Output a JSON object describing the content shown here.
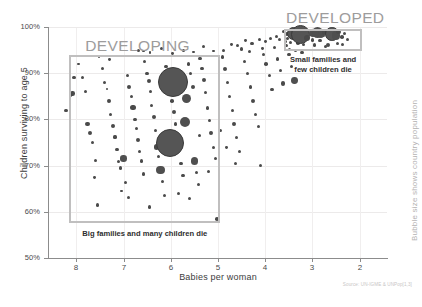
{
  "chart_data": {
    "type": "scatter",
    "title": "",
    "xlabel": "Babies per woman",
    "ylabel": "Children surviving to age 5",
    "xlim": [
      8.6,
      1.4
    ],
    "ylim": [
      50,
      100
    ],
    "x_ticks": [
      "8",
      "7",
      "6",
      "5",
      "4",
      "3",
      "2"
    ],
    "x_tick_values": [
      8,
      7,
      6,
      5,
      4,
      3,
      2
    ],
    "y_ticks": [
      "100%",
      "90%",
      "80%",
      "70%",
      "60%",
      "50%"
    ],
    "y_tick_values": [
      100,
      90,
      80,
      70,
      60,
      50
    ],
    "grid": true,
    "legend": "none",
    "size_note": "Bubble size shows country population",
    "source": "Source: UN-IGME & UNPop[1,3]",
    "annotations": [
      {
        "name": "developing",
        "label": "DEVELOPING",
        "caption": "Big families and many children die",
        "x_range": [
          8.15,
          4.95
        ],
        "y_range": [
          57.5,
          94.0
        ]
      },
      {
        "name": "developed",
        "label": "DEVELOPED",
        "caption_line1": "Small families and",
        "caption_line2": "few children die",
        "x_range": [
          3.6,
          1.95
        ],
        "y_range": [
          94.9,
          99.6
        ]
      }
    ],
    "points": [
      {
        "x": 8.05,
        "y": 89.0,
        "r": 1.6
      },
      {
        "x": 8.08,
        "y": 85.6,
        "r": 2.2
      },
      {
        "x": 8.12,
        "y": 85.3,
        "r": 1.8
      },
      {
        "x": 8.22,
        "y": 82.0,
        "r": 1.6
      },
      {
        "x": 7.86,
        "y": 89.0,
        "r": 1.5
      },
      {
        "x": 7.8,
        "y": 86.0,
        "r": 1.6
      },
      {
        "x": 7.76,
        "y": 79.0,
        "r": 2.4
      },
      {
        "x": 7.72,
        "y": 77.0,
        "r": 2.0
      },
      {
        "x": 7.66,
        "y": 75.0,
        "r": 1.8
      },
      {
        "x": 7.6,
        "y": 71.2,
        "r": 1.5
      },
      {
        "x": 7.62,
        "y": 67.5,
        "r": 1.4
      },
      {
        "x": 7.55,
        "y": 61.5,
        "r": 1.7
      },
      {
        "x": 7.95,
        "y": 92.0,
        "r": 1.3
      },
      {
        "x": 7.45,
        "y": 91.0,
        "r": 1.6
      },
      {
        "x": 7.4,
        "y": 88.0,
        "r": 1.8
      },
      {
        "x": 7.35,
        "y": 86.6,
        "r": 1.4
      },
      {
        "x": 7.3,
        "y": 84.0,
        "r": 1.9
      },
      {
        "x": 7.28,
        "y": 81.0,
        "r": 1.5
      },
      {
        "x": 7.22,
        "y": 78.5,
        "r": 2.0
      },
      {
        "x": 7.18,
        "y": 76.2,
        "r": 1.6
      },
      {
        "x": 7.14,
        "y": 73.5,
        "r": 1.9
      },
      {
        "x": 7.1,
        "y": 70.8,
        "r": 1.5
      },
      {
        "x": 7.06,
        "y": 69.5,
        "r": 1.7
      },
      {
        "x": 7.3,
        "y": 93.0,
        "r": 1.4
      },
      {
        "x": 7.0,
        "y": 71.5,
        "r": 3.2
      },
      {
        "x": 6.96,
        "y": 66.3,
        "r": 1.5
      },
      {
        "x": 6.92,
        "y": 89.5,
        "r": 1.8
      },
      {
        "x": 6.88,
        "y": 87.0,
        "r": 2.2
      },
      {
        "x": 6.84,
        "y": 85.0,
        "r": 1.6
      },
      {
        "x": 6.8,
        "y": 82.5,
        "r": 2.6
      },
      {
        "x": 6.76,
        "y": 80.0,
        "r": 1.9
      },
      {
        "x": 6.72,
        "y": 78.0,
        "r": 1.6
      },
      {
        "x": 6.7,
        "y": 75.5,
        "r": 2.1
      },
      {
        "x": 6.66,
        "y": 73.0,
        "r": 1.5
      },
      {
        "x": 6.62,
        "y": 71.0,
        "r": 1.8
      },
      {
        "x": 6.58,
        "y": 68.2,
        "r": 1.6
      },
      {
        "x": 6.55,
        "y": 92.5,
        "r": 1.5
      },
      {
        "x": 6.5,
        "y": 90.0,
        "r": 1.7
      },
      {
        "x": 6.46,
        "y": 88.4,
        "r": 2.0
      },
      {
        "x": 6.42,
        "y": 86.0,
        "r": 1.5
      },
      {
        "x": 6.4,
        "y": 83.0,
        "r": 1.6
      },
      {
        "x": 6.36,
        "y": 80.5,
        "r": 2.2
      },
      {
        "x": 6.32,
        "y": 77.5,
        "r": 1.5
      },
      {
        "x": 6.3,
        "y": 74.0,
        "r": 2.8
      },
      {
        "x": 6.26,
        "y": 72.0,
        "r": 1.6
      },
      {
        "x": 6.22,
        "y": 69.0,
        "r": 4.2
      },
      {
        "x": 6.18,
        "y": 66.5,
        "r": 1.7
      },
      {
        "x": 6.14,
        "y": 63.5,
        "r": 1.5
      },
      {
        "x": 6.1,
        "y": 91.5,
        "r": 1.6
      },
      {
        "x": 6.06,
        "y": 89.0,
        "r": 2.4
      },
      {
        "x": 6.02,
        "y": 86.5,
        "r": 1.5
      },
      {
        "x": 5.98,
        "y": 84.0,
        "r": 1.8
      },
      {
        "x": 5.94,
        "y": 81.5,
        "r": 2.0
      },
      {
        "x": 5.9,
        "y": 79.0,
        "r": 1.6
      },
      {
        "x": 5.86,
        "y": 76.0,
        "r": 1.9
      },
      {
        "x": 5.82,
        "y": 73.5,
        "r": 1.5
      },
      {
        "x": 5.78,
        "y": 70.5,
        "r": 1.7
      },
      {
        "x": 5.74,
        "y": 67.8,
        "r": 1.6
      },
      {
        "x": 5.95,
        "y": 88.2,
        "r": 15.0
      },
      {
        "x": 6.02,
        "y": 75.0,
        "r": 14.0
      },
      {
        "x": 5.66,
        "y": 84.5,
        "r": 4.5
      },
      {
        "x": 5.7,
        "y": 79.5,
        "r": 5.0
      },
      {
        "x": 5.62,
        "y": 92.0,
        "r": 1.7
      },
      {
        "x": 5.58,
        "y": 90.0,
        "r": 1.5
      },
      {
        "x": 5.54,
        "y": 87.0,
        "r": 2.0
      },
      {
        "x": 5.5,
        "y": 71.0,
        "r": 3.6
      },
      {
        "x": 5.46,
        "y": 68.5,
        "r": 1.6
      },
      {
        "x": 5.42,
        "y": 66.0,
        "r": 1.5
      },
      {
        "x": 5.38,
        "y": 93.2,
        "r": 1.8
      },
      {
        "x": 5.34,
        "y": 91.0,
        "r": 1.6
      },
      {
        "x": 5.3,
        "y": 88.5,
        "r": 2.2
      },
      {
        "x": 5.26,
        "y": 85.8,
        "r": 1.5
      },
      {
        "x": 5.22,
        "y": 82.5,
        "r": 1.7
      },
      {
        "x": 5.18,
        "y": 79.8,
        "r": 1.6
      },
      {
        "x": 5.14,
        "y": 77.0,
        "r": 1.9
      },
      {
        "x": 5.1,
        "y": 74.0,
        "r": 1.5
      },
      {
        "x": 5.06,
        "y": 71.5,
        "r": 1.6
      },
      {
        "x": 5.02,
        "y": 58.5,
        "r": 1.8
      },
      {
        "x": 4.9,
        "y": 93.5,
        "r": 1.6
      },
      {
        "x": 4.86,
        "y": 91.0,
        "r": 2.0
      },
      {
        "x": 4.8,
        "y": 88.0,
        "r": 1.5
      },
      {
        "x": 4.76,
        "y": 85.0,
        "r": 1.7
      },
      {
        "x": 4.7,
        "y": 82.0,
        "r": 1.6
      },
      {
        "x": 4.66,
        "y": 79.0,
        "r": 1.9
      },
      {
        "x": 4.6,
        "y": 76.0,
        "r": 1.5
      },
      {
        "x": 4.55,
        "y": 73.0,
        "r": 1.6
      },
      {
        "x": 4.5,
        "y": 95.2,
        "r": 1.8
      },
      {
        "x": 4.44,
        "y": 92.5,
        "r": 1.5
      },
      {
        "x": 4.38,
        "y": 90.0,
        "r": 1.7
      },
      {
        "x": 4.32,
        "y": 87.0,
        "r": 1.6
      },
      {
        "x": 4.26,
        "y": 84.0,
        "r": 2.1
      },
      {
        "x": 4.2,
        "y": 81.0,
        "r": 1.5
      },
      {
        "x": 4.14,
        "y": 78.5,
        "r": 1.6
      },
      {
        "x": 4.1,
        "y": 70.0,
        "r": 1.7
      },
      {
        "x": 4.04,
        "y": 94.0,
        "r": 1.6
      },
      {
        "x": 3.98,
        "y": 92.0,
        "r": 1.8
      },
      {
        "x": 3.92,
        "y": 89.5,
        "r": 1.5
      },
      {
        "x": 3.86,
        "y": 86.5,
        "r": 1.7
      },
      {
        "x": 3.8,
        "y": 95.5,
        "r": 1.6
      },
      {
        "x": 3.74,
        "y": 93.0,
        "r": 1.9
      },
      {
        "x": 3.68,
        "y": 90.5,
        "r": 1.5
      },
      {
        "x": 3.62,
        "y": 87.8,
        "r": 2.2
      },
      {
        "x": 3.56,
        "y": 96.0,
        "r": 1.6
      },
      {
        "x": 3.5,
        "y": 94.0,
        "r": 1.7
      },
      {
        "x": 3.44,
        "y": 91.5,
        "r": 1.5
      },
      {
        "x": 3.38,
        "y": 88.5,
        "r": 3.4
      },
      {
        "x": 3.3,
        "y": 96.5,
        "r": 1.8
      },
      {
        "x": 3.22,
        "y": 94.5,
        "r": 1.6
      },
      {
        "x": 3.52,
        "y": 97.5,
        "r": 1.5
      },
      {
        "x": 3.44,
        "y": 98.0,
        "r": 1.6
      },
      {
        "x": 3.3,
        "y": 98.3,
        "r": 1.7
      },
      {
        "x": 3.18,
        "y": 97.8,
        "r": 1.5
      },
      {
        "x": 3.1,
        "y": 98.5,
        "r": 1.6
      },
      {
        "x": 3.0,
        "y": 97.2,
        "r": 1.8
      },
      {
        "x": 2.92,
        "y": 98.6,
        "r": 1.5
      },
      {
        "x": 2.84,
        "y": 97.0,
        "r": 1.6
      },
      {
        "x": 2.76,
        "y": 98.2,
        "r": 1.7
      },
      {
        "x": 2.68,
        "y": 96.0,
        "r": 2.0
      },
      {
        "x": 2.6,
        "y": 98.8,
        "r": 1.5
      },
      {
        "x": 3.62,
        "y": 99.0,
        "r": 1.6
      },
      {
        "x": 3.48,
        "y": 95.2,
        "r": 1.5
      },
      {
        "x": 3.36,
        "y": 95.0,
        "r": 1.6
      },
      {
        "x": 3.54,
        "y": 98.5,
        "r": 2.2
      },
      {
        "x": 3.4,
        "y": 98.7,
        "r": 6.5
      },
      {
        "x": 3.26,
        "y": 98.4,
        "r": 9.5
      },
      {
        "x": 3.12,
        "y": 97.6,
        "r": 3.0
      },
      {
        "x": 2.98,
        "y": 98.6,
        "r": 4.0
      },
      {
        "x": 2.9,
        "y": 98.8,
        "r": 5.5
      },
      {
        "x": 2.82,
        "y": 98.4,
        "r": 3.2
      },
      {
        "x": 2.74,
        "y": 98.9,
        "r": 2.6
      },
      {
        "x": 2.66,
        "y": 97.9,
        "r": 1.8
      },
      {
        "x": 2.58,
        "y": 98.5,
        "r": 6.8
      },
      {
        "x": 2.5,
        "y": 98.2,
        "r": 4.2
      },
      {
        "x": 2.44,
        "y": 98.9,
        "r": 2.4
      },
      {
        "x": 2.38,
        "y": 97.8,
        "r": 1.8
      },
      {
        "x": 2.32,
        "y": 98.6,
        "r": 1.6
      },
      {
        "x": 2.26,
        "y": 97.4,
        "r": 1.5
      },
      {
        "x": 3.46,
        "y": 96.6,
        "r": 1.6
      },
      {
        "x": 3.2,
        "y": 96.3,
        "r": 1.5
      },
      {
        "x": 2.96,
        "y": 96.1,
        "r": 1.8
      },
      {
        "x": 2.72,
        "y": 95.8,
        "r": 1.6
      },
      {
        "x": 2.48,
        "y": 96.4,
        "r": 1.5
      },
      {
        "x": 3.58,
        "y": 96.8,
        "r": 1.5
      },
      {
        "x": 2.36,
        "y": 96.2,
        "r": 1.6
      },
      {
        "x": 3.7,
        "y": 97.2,
        "r": 1.5
      },
      {
        "x": 3.76,
        "y": 98.0,
        "r": 1.6
      },
      {
        "x": 3.88,
        "y": 97.5,
        "r": 1.5
      },
      {
        "x": 4.0,
        "y": 96.8,
        "r": 1.4
      },
      {
        "x": 4.12,
        "y": 97.3,
        "r": 1.5
      },
      {
        "x": 4.28,
        "y": 96.5,
        "r": 1.6
      },
      {
        "x": 4.42,
        "y": 97.0,
        "r": 1.4
      },
      {
        "x": 4.58,
        "y": 95.9,
        "r": 1.5
      },
      {
        "x": 4.72,
        "y": 96.2,
        "r": 1.4
      },
      {
        "x": 4.88,
        "y": 95.0,
        "r": 1.5
      },
      {
        "x": 5.1,
        "y": 94.8,
        "r": 1.4
      },
      {
        "x": 5.3,
        "y": 95.8,
        "r": 1.5
      },
      {
        "x": 5.52,
        "y": 94.6,
        "r": 1.4
      },
      {
        "x": 5.74,
        "y": 95.0,
        "r": 1.5
      },
      {
        "x": 5.96,
        "y": 94.2,
        "r": 1.4
      },
      {
        "x": 6.2,
        "y": 95.3,
        "r": 1.5
      },
      {
        "x": 6.44,
        "y": 94.4,
        "r": 1.4
      },
      {
        "x": 6.68,
        "y": 95.0,
        "r": 1.5
      },
      {
        "x": 4.34,
        "y": 94.6,
        "r": 1.5
      },
      {
        "x": 4.06,
        "y": 95.3,
        "r": 1.4
      },
      {
        "x": 5.84,
        "y": 64.0,
        "r": 1.6
      },
      {
        "x": 5.6,
        "y": 62.8,
        "r": 1.5
      },
      {
        "x": 6.45,
        "y": 61.0,
        "r": 1.7
      },
      {
        "x": 6.9,
        "y": 63.0,
        "r": 1.5
      },
      {
        "x": 7.05,
        "y": 64.5,
        "r": 1.4
      },
      {
        "x": 5.4,
        "y": 76.5,
        "r": 1.5
      },
      {
        "x": 5.2,
        "y": 68.8,
        "r": 1.6
      },
      {
        "x": 4.95,
        "y": 77.5,
        "r": 1.5
      },
      {
        "x": 4.82,
        "y": 74.0,
        "r": 1.4
      },
      {
        "x": 4.64,
        "y": 70.5,
        "r": 1.5
      },
      {
        "x": 6.58,
        "y": 94.8,
        "r": 1.4
      },
      {
        "x": 7.52,
        "y": 93.5,
        "r": 1.3
      }
    ]
  }
}
